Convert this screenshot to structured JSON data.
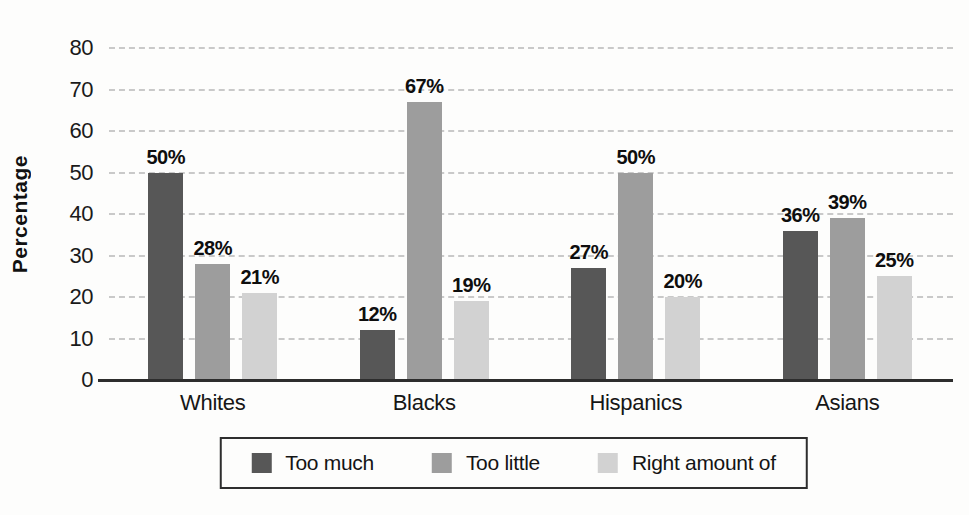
{
  "chart_data": {
    "type": "bar",
    "title": "",
    "ylabel": "Percentage",
    "xlabel": "",
    "categories": [
      "Whites",
      "Blacks",
      "Hispanics",
      "Asians"
    ],
    "series": [
      {
        "name": "Too much",
        "color": "#575757",
        "values": [
          50,
          12,
          27,
          36
        ]
      },
      {
        "name": "Too little",
        "color": "#9d9d9d",
        "values": [
          28,
          67,
          50,
          39
        ]
      },
      {
        "name": "Right amount of",
        "color": "#d2d2d2",
        "values": [
          21,
          19,
          20,
          25
        ]
      }
    ],
    "value_label_format": "{v}%",
    "ylim": [
      0,
      80
    ],
    "ytick_step": 10,
    "yticks": [
      0,
      10,
      20,
      30,
      40,
      50,
      60,
      70,
      80
    ],
    "grid": true,
    "grid_style": "dashed",
    "legend_position": "bottom"
  },
  "styles": {
    "background": "#fdfdfc",
    "grid_color": "#c9c9c9",
    "axis_color": "#2d2d2d",
    "text_color": "#151515"
  }
}
